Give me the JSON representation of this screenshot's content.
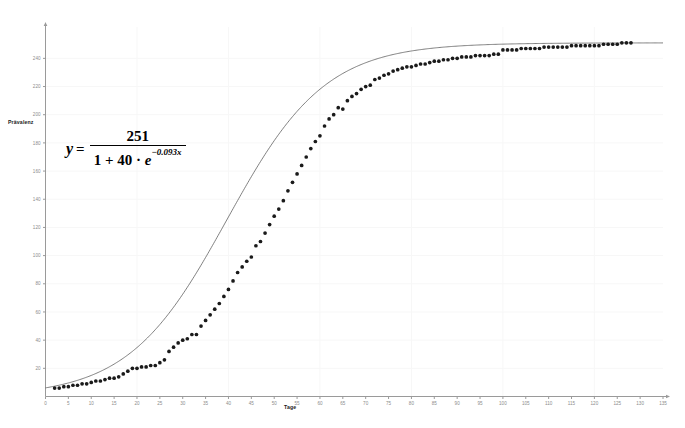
{
  "chart_data": {
    "type": "scatter",
    "title": "",
    "xlabel": "Tage",
    "ylabel": "Prävalenz",
    "xlim": [
      0,
      135
    ],
    "ylim": [
      0,
      258
    ],
    "grid": true,
    "legend": "none",
    "equation": {
      "lhs": "y",
      "equals": "=",
      "numerator": "251",
      "denominator_prefix": "1 + 40 · ",
      "denominator_base": "e",
      "denominator_exponent": "−0.093x",
      "plain": "y = 251 / (1 + 40 · e^(-0.093x))"
    },
    "xticks": [
      0,
      5,
      10,
      15,
      20,
      25,
      30,
      35,
      40,
      45,
      50,
      55,
      60,
      65,
      70,
      75,
      80,
      85,
      90,
      95,
      100,
      105,
      110,
      115,
      120,
      125,
      130,
      135
    ],
    "yticks": [
      20,
      40,
      60,
      80,
      100,
      120,
      140,
      160,
      180,
      200,
      220,
      240
    ],
    "series": [
      {
        "name": "Modell",
        "type": "line",
        "color": "#555555",
        "model": "logistic",
        "L": 251,
        "A": 40,
        "k": 0.093
      },
      {
        "name": "Messwerte",
        "type": "scatter",
        "color": "#1a1a1a",
        "x": [
          2,
          3,
          4,
          5,
          6,
          7,
          8,
          9,
          10,
          11,
          12,
          13,
          14,
          15,
          16,
          17,
          18,
          19,
          20,
          21,
          22,
          23,
          24,
          25,
          26,
          27,
          28,
          29,
          30,
          31,
          32,
          33,
          34,
          35,
          36,
          37,
          38,
          39,
          40,
          41,
          42,
          43,
          44,
          45,
          46,
          47,
          48,
          49,
          50,
          51,
          52,
          53,
          54,
          55,
          56,
          57,
          58,
          59,
          60,
          61,
          62,
          63,
          64,
          65,
          66,
          67,
          68,
          69,
          70,
          71,
          72,
          73,
          74,
          75,
          76,
          77,
          78,
          79,
          80,
          81,
          82,
          83,
          84,
          85,
          86,
          87,
          88,
          89,
          90,
          91,
          92,
          93,
          94,
          95,
          96,
          97,
          98,
          99,
          100,
          101,
          102,
          103,
          104,
          105,
          106,
          107,
          108,
          109,
          110,
          111,
          112,
          113,
          114,
          115,
          116,
          117,
          118,
          119,
          120,
          121,
          122,
          123,
          124,
          125,
          126,
          127,
          128
        ],
        "y": [
          6,
          6,
          7,
          7,
          8,
          8,
          9,
          9,
          10,
          11,
          11,
          12,
          13,
          13,
          14,
          16,
          18,
          20,
          20,
          21,
          21,
          22,
          22,
          24,
          26,
          32,
          35,
          38,
          40,
          41,
          44,
          44,
          50,
          54,
          58,
          62,
          66,
          71,
          76,
          82,
          88,
          92,
          96,
          99,
          107,
          110,
          116,
          122,
          128,
          133,
          139,
          146,
          152,
          158,
          164,
          170,
          176,
          181,
          185,
          192,
          197,
          200,
          205,
          204,
          210,
          213,
          215,
          218,
          220,
          221,
          225,
          226,
          228,
          229,
          231,
          232,
          233,
          234,
          234,
          235,
          236,
          236,
          237,
          238,
          238,
          239,
          239,
          240,
          240,
          241,
          241,
          241,
          242,
          242,
          242,
          242,
          243,
          243,
          246,
          246,
          246,
          246,
          247,
          247,
          247,
          247,
          247,
          248,
          248,
          248,
          248,
          248,
          248,
          249,
          249,
          249,
          249,
          249,
          249,
          249,
          250,
          250,
          250,
          250,
          251,
          251,
          251
        ]
      }
    ]
  }
}
